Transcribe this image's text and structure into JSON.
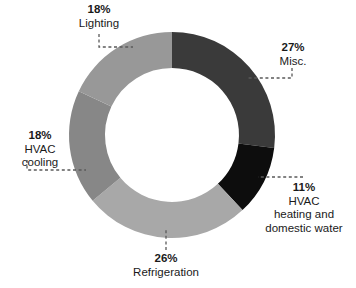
{
  "chart_data": {
    "type": "pie",
    "variant": "donut",
    "title": "",
    "subtitle": "",
    "xlabel": "",
    "ylabel": "",
    "grid": false,
    "legend_position": "none",
    "label_format": "percent-plus-name",
    "units": "percent",
    "total": 100,
    "start_angle_deg": 0,
    "direction": "clockwise",
    "center": {
      "x": 172,
      "y": 135
    },
    "outer_radius": 103,
    "inner_radius": 67,
    "categories": [
      "Misc.",
      "HVAC heating and domestic water",
      "Refrigeration",
      "HVAC cooling",
      "Lighting"
    ],
    "values": [
      27,
      11,
      26,
      18,
      18
    ],
    "colors": [
      "#3a3a3a",
      "#0d0d0d",
      "#a8a8a8",
      "#878787",
      "#989898"
    ],
    "slices": [
      {
        "name": "Misc.",
        "value": 27,
        "percent_text": "27%",
        "label_lines": [
          "Misc."
        ],
        "color": "#3a3a3a",
        "start_deg": 0,
        "end_deg": 97.2
      },
      {
        "name": "HVAC heating and domestic water",
        "value": 11,
        "percent_text": "11%",
        "label_lines": [
          "HVAC",
          "heating and",
          "domestic water"
        ],
        "color": "#0d0d0d",
        "start_deg": 97.2,
        "end_deg": 136.8
      },
      {
        "name": "Refrigeration",
        "value": 26,
        "percent_text": "26%",
        "label_lines": [
          "Refrigeration"
        ],
        "color": "#a8a8a8",
        "start_deg": 136.8,
        "end_deg": 230.4
      },
      {
        "name": "HVAC cooling",
        "value": 18,
        "percent_text": "18%",
        "label_lines": [
          "HVAC",
          "cooling"
        ],
        "color": "#878787",
        "start_deg": 230.4,
        "end_deg": 295.2
      },
      {
        "name": "Lighting",
        "value": 18,
        "percent_text": "18%",
        "label_lines": [
          "Lighting"
        ],
        "color": "#989898",
        "start_deg": 295.2,
        "end_deg": 360
      }
    ]
  },
  "labels": {
    "lighting": {
      "percent": "18%",
      "name": "Lighting"
    },
    "misc": {
      "percent": "27%",
      "name": "Misc."
    },
    "hvac_heating": {
      "percent": "11%",
      "name_line1": "HVAC",
      "name_line2": "heating and",
      "name_line3": "domestic water"
    },
    "refrigeration": {
      "percent": "26%",
      "name": "Refrigeration"
    },
    "hvac_cooling": {
      "percent": "18%",
      "name_line1": "HVAC",
      "name_line2": "cooling"
    }
  },
  "style": {
    "background": "#ffffff",
    "text_color": "#1a1a1a",
    "leader_color": "#5a5a5a"
  }
}
